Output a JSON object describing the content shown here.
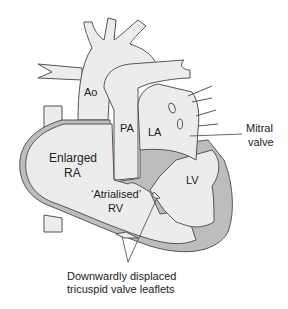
{
  "diagram": {
    "type": "anatomical-diagram",
    "colors": {
      "background": "#ffffff",
      "chamber_fill": "#ececec",
      "wall_fill": "#bdbdbd",
      "outline": "#555555",
      "text": "#222222"
    },
    "labels": {
      "ao": "Ao",
      "pa": "PA",
      "la": "LA",
      "lv": "LV",
      "ra_line1": "Enlarged",
      "ra_line2": "RA",
      "rv_line1": "‘Atrialised’",
      "rv_line2": "RV",
      "mitral_line1": "Mitral",
      "mitral_line2": "valve",
      "tricuspid_line1": "Downwardly displaced",
      "tricuspid_line2": "tricuspid valve leaflets"
    }
  }
}
